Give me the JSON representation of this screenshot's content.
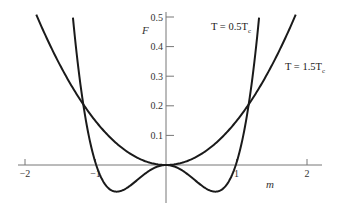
{
  "chart_data": {
    "type": "line",
    "title": "",
    "xlabel": "m",
    "ylabel": "F",
    "xlim": [
      -2,
      2
    ],
    "ylim": [
      -0.12,
      0.52
    ],
    "grid": false,
    "x_ticks": [
      -2,
      -1,
      1,
      2
    ],
    "x_tick_labels": [
      "−2",
      "−1",
      "1",
      "2"
    ],
    "y_ticks": [
      0.1,
      0.2,
      0.3,
      0.4,
      0.5
    ],
    "y_tick_labels": [
      "0.1",
      "0.2",
      "0.3",
      "0.4",
      "0.5"
    ],
    "series": [
      {
        "name": "T = 0.5T_c",
        "label_main": "T = 0.5T",
        "label_sub": "c",
        "description": "Double-well free energy with minima near m = ±0.7, F ≈ −0.09",
        "x": [
          -1.32,
          -1.2,
          -1.1,
          -1.0,
          -0.9,
          -0.8,
          -0.7,
          -0.6,
          -0.5,
          -0.4,
          -0.3,
          -0.2,
          -0.1,
          0,
          0.1,
          0.2,
          0.3,
          0.4,
          0.5,
          0.6,
          0.7,
          0.8,
          0.9,
          1.0,
          1.1,
          1.2,
          1.32
        ],
        "values": [
          0.5,
          0.3,
          0.16,
          0.04,
          -0.03,
          -0.075,
          -0.09,
          -0.085,
          -0.07,
          -0.05,
          -0.03,
          -0.013,
          -0.003,
          0,
          -0.003,
          -0.013,
          -0.03,
          -0.05,
          -0.07,
          -0.085,
          -0.09,
          -0.075,
          -0.03,
          0.04,
          0.16,
          0.3,
          0.5
        ]
      },
      {
        "name": "T = 1.5T_c",
        "label_main": "T = 1.5T",
        "label_sub": "c",
        "description": "Single-well free energy with minimum at m = 0",
        "x": [
          -1.9,
          -1.6,
          -1.4,
          -1.2,
          -1.0,
          -0.8,
          -0.6,
          -0.4,
          -0.2,
          0,
          0.2,
          0.4,
          0.6,
          0.8,
          1.0,
          1.2,
          1.4,
          1.6,
          1.9
        ],
        "values": [
          0.5,
          0.37,
          0.29,
          0.22,
          0.155,
          0.1,
          0.055,
          0.024,
          0.006,
          0,
          0.006,
          0.024,
          0.055,
          0.1,
          0.155,
          0.22,
          0.29,
          0.37,
          0.5
        ]
      }
    ],
    "annotations": [
      {
        "text": "T = 0.5T_c",
        "near": [
          0.6,
          0.47
        ]
      },
      {
        "text": "T = 1.5T_c",
        "near": [
          1.3,
          0.3
        ]
      }
    ],
    "legend": "inline curve labels"
  }
}
